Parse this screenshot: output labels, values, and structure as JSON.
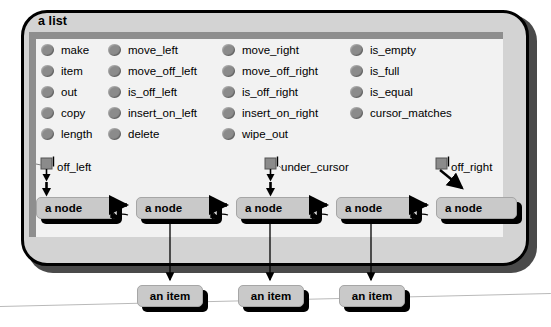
{
  "diagram": {
    "title": "a list",
    "feature_columns": [
      {
        "items": [
          "make",
          "item",
          "out",
          "copy",
          "length"
        ]
      },
      {
        "items": [
          "move_left",
          "move_off_left",
          "is_off_left",
          "insert_on_left",
          "delete"
        ]
      },
      {
        "items": [
          "move_right",
          "move_off_right",
          "is_off_right",
          "insert_on_right",
          "wipe_out"
        ]
      },
      {
        "items": [
          "is_empty",
          "is_full",
          "is_equal",
          "cursor_matches"
        ]
      }
    ],
    "cursor_markers": [
      {
        "label": "off_left",
        "icon": "cursor-marker-icon"
      },
      {
        "label": "under_cursor",
        "icon": "cursor-marker-icon"
      },
      {
        "label": "off_right",
        "icon": "cursor-marker-icon"
      }
    ],
    "nodes": [
      {
        "label": "a node"
      },
      {
        "label": "a node"
      },
      {
        "label": "a node"
      },
      {
        "label": "a node"
      },
      {
        "label": "a node"
      }
    ],
    "items": [
      {
        "label": "an item"
      },
      {
        "label": "an item"
      },
      {
        "label": "an item"
      }
    ],
    "colors": {
      "panel_fill": "#d3d3d3",
      "inner_fill": "#f2f2f2",
      "inner_bar": "#8e8e8e",
      "box_fill": "#c9c9c9",
      "bullet": "#8b8b8b",
      "stroke": "#000000",
      "hairline": "#b9b9b9"
    }
  }
}
